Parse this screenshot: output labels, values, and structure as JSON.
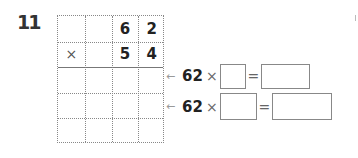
{
  "question": {
    "number": "11"
  },
  "grid": {
    "rows": [
      [
        "",
        "",
        "6",
        "2"
      ],
      [
        "×",
        "",
        "5",
        "4"
      ],
      [
        "",
        "",
        "",
        ""
      ],
      [
        "",
        "",
        "",
        ""
      ],
      [
        "",
        "",
        "",
        ""
      ]
    ]
  },
  "equations": [
    {
      "arrow": "←",
      "multiplicand": "62",
      "times": "×",
      "equals": "=",
      "factor_value": "",
      "result_value": ""
    },
    {
      "arrow": "←",
      "multiplicand": "62",
      "times": "×",
      "equals": "=",
      "factor_value": "",
      "result_value": ""
    }
  ]
}
